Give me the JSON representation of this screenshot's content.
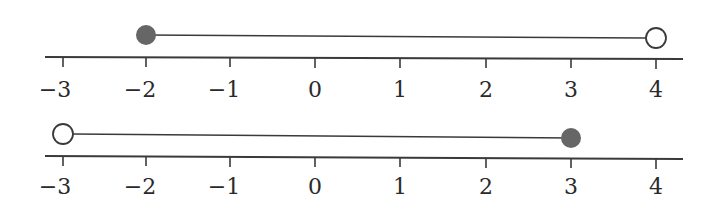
{
  "colors": {
    "line": "#3a3a3a",
    "filled_dot": "#666666",
    "open_dot_fill": "#ffffff",
    "text": "#2a2a2a"
  },
  "tick_labels": [
    "−3",
    "−2",
    "−1",
    "0",
    "1",
    "2",
    "3",
    "4"
  ],
  "number_lines": [
    {
      "name": "number-line-1",
      "interval": "[-2, 4)",
      "start": {
        "value": -2,
        "type": "closed"
      },
      "end": {
        "value": 4,
        "type": "open"
      }
    },
    {
      "name": "number-line-2",
      "interval": "(-3, 3]",
      "start": {
        "value": -3,
        "type": "open"
      },
      "end": {
        "value": 3,
        "type": "closed"
      }
    }
  ]
}
